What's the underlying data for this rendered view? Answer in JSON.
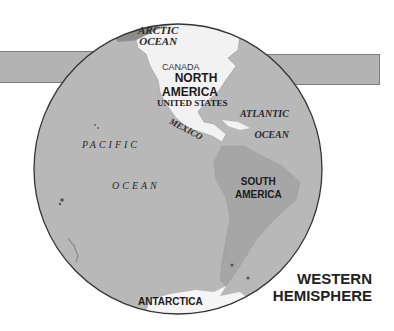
{
  "map": {
    "title_line1": "WESTERN",
    "title_line2": "HEMISPHERE",
    "labels": {
      "arctic_line1": "ARCTIC",
      "arctic_line2": "OCEAN",
      "canada": "CANADA",
      "north_america_line1": "NORTH",
      "north_america_line2": "AMERICA",
      "united_states": "UNITED STATES",
      "mexico": "MEXICO",
      "atlantic_line1": "ATLANTIC",
      "atlantic_line2": "OCEAN",
      "pacific_line1": "PACIFIC",
      "pacific_line2": "OCEAN",
      "south_america_line1": "SOUTH",
      "south_america_line2": "AMERICA",
      "antarctica": "ANTARCTICA"
    },
    "colors": {
      "ocean": "#b8b8b8",
      "land_north": "#f2f2f2",
      "land_south": "#a6a6a6",
      "band": "#b3b3b3",
      "outline": "#333333"
    }
  }
}
